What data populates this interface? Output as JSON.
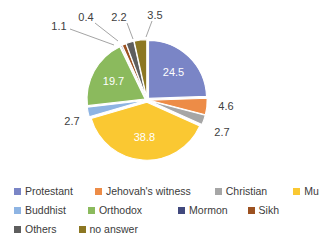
{
  "chart_data": {
    "type": "pie",
    "title": "",
    "xlabel": "",
    "ylabel": "",
    "legend_position": "bottom",
    "grid": false,
    "categories": [
      "Protestant",
      "Jehovah's witness",
      "Christian",
      "Muslim",
      "Buddhist",
      "Orthodox",
      "Mormon",
      "Sikh",
      "Others",
      "no answer"
    ],
    "values": [
      24.5,
      4.6,
      2.7,
      38.8,
      2.7,
      19.7,
      0.4,
      1.1,
      2.2,
      3.5
    ],
    "colors": [
      "#7a85c6",
      "#ed8c47",
      "#a6a6a6",
      "#fac832",
      "#8eb4e3",
      "#8bba5d",
      "#41497d",
      "#9c5120",
      "#5e5e5e",
      "#8c7722"
    ],
    "labels": [
      {
        "category": "Protestant",
        "text": "24.5",
        "placement": "inside"
      },
      {
        "category": "Jehovah's witness",
        "text": "4.6",
        "placement": "outside"
      },
      {
        "category": "Christian",
        "text": "2.7",
        "placement": "outside"
      },
      {
        "category": "Muslim",
        "text": "38.8",
        "placement": "inside"
      },
      {
        "category": "Buddhist",
        "text": "2.7",
        "placement": "outside"
      },
      {
        "category": "Orthodox",
        "text": "19.7",
        "placement": "inside"
      },
      {
        "category": "Mormon",
        "text": "0.4",
        "placement": "outside-leader"
      },
      {
        "category": "Sikh",
        "text": "1.1",
        "placement": "outside-leader"
      },
      {
        "category": "Others",
        "text": "2.2",
        "placement": "outside-leader"
      },
      {
        "category": "no answer",
        "text": "3.5",
        "placement": "outside-leader"
      }
    ]
  },
  "legend": {
    "rows": [
      [
        {
          "label": "Protestant",
          "color": "#7a85c6"
        },
        {
          "label": "Jehovah's witness",
          "color": "#ed8c47"
        },
        {
          "label": "Christian",
          "color": "#a6a6a6"
        },
        {
          "label": "Muslim",
          "color": "#fac832"
        }
      ],
      [
        {
          "label": "Buddhist",
          "color": "#8eb4e3"
        },
        {
          "label": "Orthodox",
          "color": "#8bba5d"
        },
        {
          "label": "Mormon",
          "color": "#41497d"
        },
        {
          "label": "Sikh",
          "color": "#9c5120"
        }
      ],
      [
        {
          "label": "Others",
          "color": "#5e5e5e"
        },
        {
          "label": "no answer",
          "color": "#8c7722"
        }
      ]
    ]
  }
}
